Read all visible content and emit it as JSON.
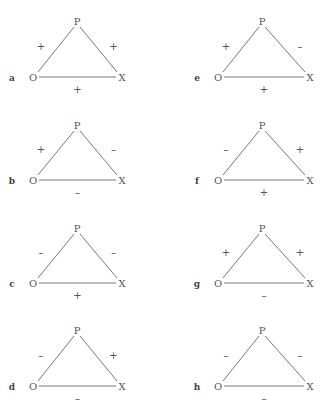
{
  "diagram": {
    "type": "signed-triangles",
    "node_labels": {
      "top": "P",
      "left": "O",
      "right": "X"
    },
    "panels": [
      {
        "id": "a",
        "col": 0,
        "row": 0,
        "po": "+",
        "px": "+",
        "ox": "+"
      },
      {
        "id": "b",
        "col": 0,
        "row": 1,
        "po": "+",
        "px": "–",
        "ox": "–"
      },
      {
        "id": "c",
        "col": 0,
        "row": 2,
        "po": "–",
        "px": "–",
        "ox": "+"
      },
      {
        "id": "d",
        "col": 0,
        "row": 3,
        "po": "–",
        "px": "+",
        "ox": "–"
      },
      {
        "id": "e",
        "col": 1,
        "row": 0,
        "po": "+",
        "px": "–",
        "ox": "+"
      },
      {
        "id": "f",
        "col": 1,
        "row": 1,
        "po": "–",
        "px": "+",
        "ox": "+"
      },
      {
        "id": "g",
        "col": 1,
        "row": 2,
        "po": "+",
        "px": "+",
        "ox": "–"
      },
      {
        "id": "h",
        "col": 1,
        "row": 3,
        "po": "–",
        "px": "–",
        "ox": "–"
      }
    ]
  },
  "colors": {
    "line": "#777777",
    "text": "#555555",
    "background": "#ffffff"
  }
}
